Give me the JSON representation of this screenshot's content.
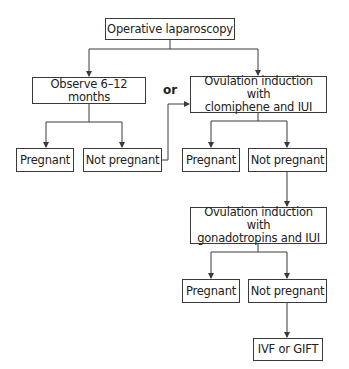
{
  "flowchart": {
    "nodes": {
      "operative_laparoscopy": "Operative laparoscopy",
      "observe": "Observe 6–12 months",
      "or_label": "or",
      "clomiphene_line1": "Ovulation induction with",
      "clomiphene_line2": "clomiphene and IUI",
      "pregnant_1": "Pregnant",
      "not_pregnant_1": "Not pregnant",
      "pregnant_2": "Pregnant",
      "not_pregnant_2": "Not pregnant",
      "gonadotropins_line1": "Ovulation induction with",
      "gonadotropins_line2": "gonadotropins and IUI",
      "pregnant_3": "Pregnant",
      "not_pregnant_3": "Not pregnant",
      "ivf": "IVF or GIFT"
    },
    "edges": [
      [
        "Operative laparoscopy",
        "Observe 6–12 months"
      ],
      [
        "Operative laparoscopy",
        "Ovulation induction with clomiphene and IUI"
      ],
      [
        "Observe 6–12 months",
        "Pregnant"
      ],
      [
        "Observe 6–12 months",
        "Not pregnant"
      ],
      [
        "Not pregnant",
        "Ovulation induction with clomiphene and IUI"
      ],
      [
        "Ovulation induction with clomiphene and IUI",
        "Pregnant"
      ],
      [
        "Ovulation induction with clomiphene and IUI",
        "Not pregnant"
      ],
      [
        "Not pregnant",
        "Ovulation induction with gonadotropins and IUI"
      ],
      [
        "Ovulation induction with gonadotropins and IUI",
        "Pregnant"
      ],
      [
        "Ovulation induction with gonadotropins and IUI",
        "Not pregnant"
      ],
      [
        "Not pregnant",
        "IVF or GIFT"
      ]
    ]
  }
}
